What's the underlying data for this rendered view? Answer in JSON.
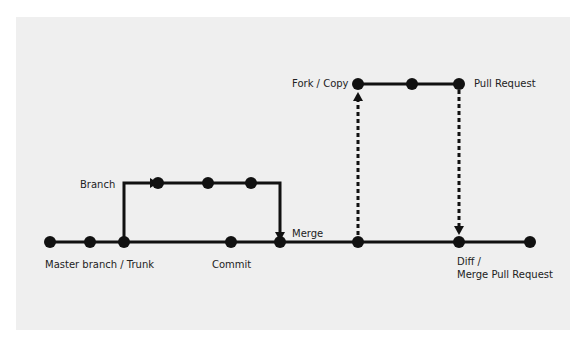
{
  "diagram": {
    "colors": {
      "background": "#efefef",
      "line": "#111111",
      "text": "#222222"
    },
    "labels": {
      "trunk": "Master branch / Trunk",
      "branch": "Branch",
      "merge": "Merge",
      "commit": "Commit",
      "fork": "Fork / Copy",
      "pull_request": "Pull Request",
      "diff_line1": "Diff /",
      "diff_line2": "Merge Pull Request"
    },
    "trunk_nodes_x": [
      50,
      90,
      124,
      231,
      280,
      358,
      459,
      530
    ],
    "branch_nodes_x": [
      158,
      208,
      251
    ],
    "fork_nodes_x": [
      358,
      412,
      459
    ]
  }
}
